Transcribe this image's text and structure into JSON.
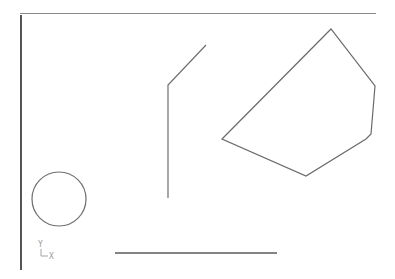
{
  "viewport": {
    "background": "#ffffff",
    "frame": {
      "left_line": {
        "x": 21,
        "y1": 15,
        "y2": 270,
        "color": "#2a2a2a",
        "width": 1.6
      },
      "top_line": {
        "y": 13.5,
        "x1": 20,
        "x2": 376,
        "color": "#8a8a8a",
        "width": 1.2
      }
    }
  },
  "entities": {
    "polyline_bent": {
      "type": "polyline",
      "points": [
        [
          206,
          45
        ],
        [
          168,
          85
        ],
        [
          168,
          198
        ]
      ],
      "color": "#6e6e6e"
    },
    "polygon": {
      "type": "polygon",
      "points": [
        [
          222,
          139
        ],
        [
          331,
          29
        ],
        [
          375,
          86
        ],
        [
          371,
          134
        ],
        [
          366,
          139
        ],
        [
          306,
          176
        ]
      ],
      "color": "#6a6a6a"
    },
    "circle": {
      "type": "circle",
      "cx": 59,
      "cy": 199,
      "r": 27,
      "color": "#6e6e6e"
    },
    "bottom_line": {
      "type": "line",
      "x1": 115,
      "y1": 253,
      "x2": 277,
      "y2": 253,
      "color": "#5a5a5a"
    }
  },
  "ucs_icon": {
    "y_label": "Y",
    "x_label": "X",
    "color": "#9a9a9a"
  }
}
